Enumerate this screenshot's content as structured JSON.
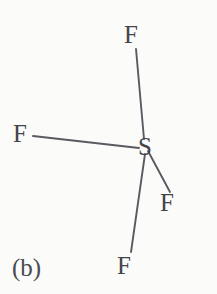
{
  "figure": {
    "panel_label": "(b)",
    "width": 217,
    "height": 294,
    "background_color": "#fbfbfa",
    "bond_color": "#5a5a60",
    "label_color": "#44444a"
  },
  "molecule": {
    "name": "sulfur-tetrafluoride",
    "central_atom": {
      "label": "S",
      "x": 145,
      "y": 146
    },
    "ligands": [
      {
        "id": "f-top",
        "label": "F",
        "x": 131,
        "y": 35,
        "bond_x1": 136,
        "bond_y1": 49,
        "bond_x2": 144,
        "bond_y2": 139
      },
      {
        "id": "f-left",
        "label": "F",
        "x": 20,
        "y": 134,
        "bond_x1": 33,
        "bond_y1": 136,
        "bond_x2": 139,
        "bond_y2": 148
      },
      {
        "id": "f-lower-right",
        "label": "F",
        "x": 167,
        "y": 203,
        "bond_x1": 148,
        "bond_y1": 151,
        "bond_x2": 170,
        "bond_y2": 192
      },
      {
        "id": "f-bottom",
        "label": "F",
        "x": 124,
        "y": 266,
        "bond_x1": 145,
        "bond_y1": 154,
        "bond_x2": 131,
        "bond_y2": 252
      }
    ]
  },
  "chart_data": {
    "type": "diagram",
    "title": "(b)",
    "subtitle": "",
    "xlabel": "",
    "ylabel": "",
    "nodes": [
      {
        "name": "S",
        "role": "central-atom",
        "x": 145,
        "y": 146
      },
      {
        "name": "F",
        "role": "axial-ligand",
        "x": 131,
        "y": 35
      },
      {
        "name": "F",
        "role": "equatorial-ligand",
        "x": 20,
        "y": 134
      },
      {
        "name": "F",
        "role": "equatorial-ligand",
        "x": 167,
        "y": 203
      },
      {
        "name": "F",
        "role": "axial-ligand",
        "x": 124,
        "y": 266
      }
    ],
    "edges": [
      {
        "from": "S",
        "to": "F-top",
        "type": "single-bond"
      },
      {
        "from": "S",
        "to": "F-left",
        "type": "single-bond"
      },
      {
        "from": "S",
        "to": "F-lower-right",
        "type": "single-bond"
      },
      {
        "from": "S",
        "to": "F-bottom",
        "type": "single-bond"
      }
    ],
    "legend": [],
    "annotations": [
      "(b)"
    ]
  }
}
